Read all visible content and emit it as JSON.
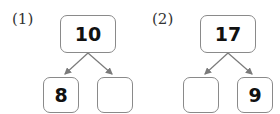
{
  "problems": [
    {
      "label": "(1)",
      "top": "10",
      "left": "8",
      "right": ""
    },
    {
      "label": "(2)",
      "top": "17",
      "left": "",
      "right": "9"
    }
  ],
  "colors": {
    "box_border": "#8a8a8a",
    "arrow": "#7a7a7a",
    "text": "#111111"
  }
}
